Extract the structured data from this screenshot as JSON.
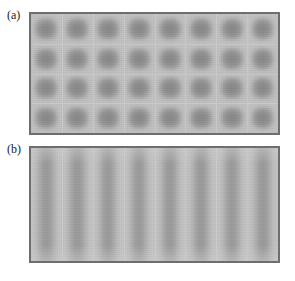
{
  "figure": {
    "background_color": "#ffffff",
    "width": 295,
    "height": 281,
    "panels": [
      {
        "id": "a",
        "label": "(a)",
        "border_color": "#6e6e6e",
        "background_color": "#c2c2c2",
        "blob_color": "#868686",
        "columns": 8,
        "rows": 4,
        "site_count": 32,
        "pattern": "two-dimensional square lattice of rounded intensity maxima"
      },
      {
        "id": "b",
        "label": "(b)",
        "border_color": "#6e6e6e",
        "background_color": "#c4c4c4",
        "blob_color": "#979797",
        "columns": 8,
        "rows": 1,
        "site_count": 8,
        "pattern": "one-dimensional lattice of vertical intensity stripes"
      }
    ]
  },
  "chart_data": {
    "type": "heatmap",
    "title": "",
    "xlabel": "",
    "ylabel": "",
    "grid": false,
    "legend": "none",
    "colormap": "grayscale",
    "panels": [
      {
        "panel": "a",
        "label": "(a)",
        "type": "heatmap",
        "nx": 8,
        "ny": 4,
        "description": "8 x 4 array of dark square intensity blobs on a lighter grey background",
        "intensity_min": 0.0,
        "intensity_max": 1.0,
        "background_level": 0.24,
        "peak_level": 1.0,
        "values": [
          [
            1.0,
            0.98,
            0.99,
            1.0,
            0.97,
            0.98,
            0.93,
            0.96
          ],
          [
            0.99,
            1.0,
            1.0,
            0.99,
            1.0,
            0.98,
            0.97,
            0.98
          ],
          [
            0.98,
            0.99,
            1.0,
            1.0,
            0.99,
            0.99,
            0.98,
            0.97
          ],
          [
            0.97,
            0.98,
            0.99,
            1.0,
            0.98,
            0.98,
            0.97,
            0.96
          ]
        ]
      },
      {
        "panel": "b",
        "label": "(b)",
        "type": "heatmap",
        "nx": 8,
        "ny": 1,
        "description": "8 vertical intensity stripes spanning the full panel height, lower contrast than panel (a)",
        "intensity_min": 0.0,
        "intensity_max": 1.0,
        "background_level": 0.18,
        "peak_level": 0.62,
        "values": [
          [
            0.58,
            0.6,
            0.61,
            0.62,
            0.6,
            0.59,
            0.57,
            0.6
          ]
        ]
      }
    ]
  }
}
